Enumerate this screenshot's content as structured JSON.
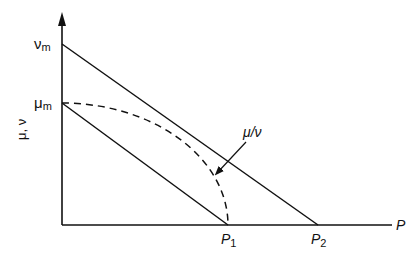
{
  "diagram": {
    "y_axis_label": "μ, ν",
    "x_axis_label": "P",
    "y_ticks": [
      {
        "symbol": "ν",
        "sub": "m",
        "y": 44
      },
      {
        "symbol": "μ",
        "sub": "m",
        "y": 103
      }
    ],
    "x_ticks": [
      {
        "symbol": "P",
        "sub": "1",
        "x": 228
      },
      {
        "symbol": "P",
        "sub": "2",
        "x": 318
      }
    ],
    "curve_label": "μ/ν",
    "lines": [
      {
        "name": "nu-line",
        "from": "ν_m",
        "to": "P_2",
        "style": "solid"
      },
      {
        "name": "mu-line",
        "from": "μ_m",
        "to": "P_1",
        "style": "solid"
      },
      {
        "name": "mu-over-nu-curve",
        "from": "μ_m",
        "to": "P_1",
        "style": "dashed"
      }
    ],
    "colors": {
      "ink": "#111111",
      "background": "#ffffff"
    }
  }
}
